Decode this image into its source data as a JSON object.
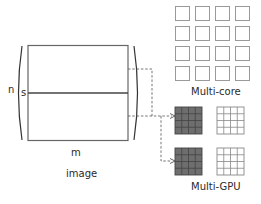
{
  "image": {
    "label": "image",
    "dim_rows": "n",
    "dim_cols": "m",
    "split_label": "s"
  },
  "multicore": {
    "label": "Multi-core",
    "grid_rows": 4,
    "grid_cols": 4
  },
  "multigpu": {
    "label": "Multi-GPU",
    "devices": 2,
    "grid_rows": 4,
    "grid_cols": 4,
    "active_color": "#6e6e6e",
    "inactive_color": "#ffffff"
  },
  "colors": {
    "stroke": "#555555",
    "dashed": "#666666",
    "core_stroke": "#9a9a9a"
  }
}
